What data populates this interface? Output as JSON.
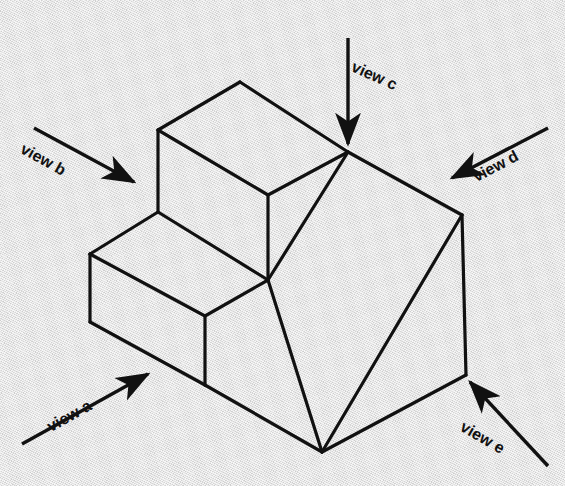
{
  "figure": {
    "kind": "isometric-technical-drawing",
    "background_color": "#e8e8e8",
    "line_color": "#111111",
    "stroke_width_main": 3.2,
    "stroke_width_thin": 2.6
  },
  "annotations": {
    "arrows": [
      {
        "id": "view-a",
        "label": "view a",
        "direction": "up-right",
        "tail": [
          22,
          444
        ],
        "head": [
          148,
          374
        ],
        "label_x": 44,
        "label_y": 420,
        "label_rotation": -29
      },
      {
        "id": "view-b",
        "label": "view b",
        "direction": "down-right",
        "tail": [
          34,
          128
        ],
        "head": [
          134,
          182
        ],
        "label_x": 26,
        "label_y": 140,
        "label_rotation": 29
      },
      {
        "id": "view-c",
        "label": "view c",
        "direction": "down",
        "tail": [
          348,
          38
        ],
        "head": [
          348,
          144
        ],
        "label_x": 356,
        "label_y": 58,
        "label_rotation": 24
      },
      {
        "id": "view-d",
        "label": "view d",
        "direction": "down-left",
        "tail": [
          548,
          128
        ],
        "head": [
          452,
          178
        ],
        "label_x": 470,
        "label_y": 170,
        "label_rotation": -28
      },
      {
        "id": "view-e",
        "label": "view e",
        "direction": "up-left",
        "tail": [
          548,
          466
        ],
        "head": [
          470,
          382
        ],
        "label_x": 466,
        "label_y": 418,
        "label_rotation": 30
      }
    ]
  },
  "solid": {
    "vertices": {
      "top_back": [
        240,
        82
      ],
      "top_left": [
        158,
        130
      ],
      "top_right_apex": [
        348,
        152
      ],
      "upper_riser_mid": [
        268,
        195
      ],
      "step_left": [
        90,
        254
      ],
      "center": [
        268,
        280
      ],
      "lower_left_bot": [
        90,
        322
      ],
      "lower_front_bot": [
        205,
        385
      ],
      "right_top": [
        462,
        215
      ],
      "right_bot": [
        466,
        375
      ],
      "bottom_front": [
        322,
        452
      ]
    },
    "edges": [
      {
        "name": "upper-top-back-left",
        "from": [
          240,
          82
        ],
        "to": [
          158,
          130
        ]
      },
      {
        "name": "upper-top-back-right",
        "from": [
          240,
          82
        ],
        "to": [
          348,
          152
        ]
      },
      {
        "name": "upper-top-front-left",
        "from": [
          158,
          130
        ],
        "to": [
          268,
          195
        ]
      },
      {
        "name": "upper-top-front-right",
        "from": [
          268,
          195
        ],
        "to": [
          348,
          152
        ]
      },
      {
        "name": "upper-left-riser",
        "from": [
          158,
          130
        ],
        "to": [
          158,
          212
        ]
      },
      {
        "name": "upper-mid-riser",
        "from": [
          268,
          195
        ],
        "to": [
          268,
          280
        ]
      },
      {
        "name": "step-tread-left",
        "from": [
          158,
          212
        ],
        "to": [
          90,
          254
        ]
      },
      {
        "name": "step-tread-right",
        "from": [
          158,
          212
        ],
        "to": [
          268,
          280
        ]
      },
      {
        "name": "lower-left-riser",
        "from": [
          90,
          254
        ],
        "to": [
          90,
          322
        ]
      },
      {
        "name": "lower-top-front",
        "from": [
          90,
          254
        ],
        "to": [
          205,
          316
        ]
      },
      {
        "name": "lower-front-right",
        "from": [
          205,
          316
        ],
        "to": [
          268,
          280
        ]
      },
      {
        "name": "lower-front-riser",
        "from": [
          205,
          316
        ],
        "to": [
          205,
          385
        ]
      },
      {
        "name": "bottom-front-left",
        "from": [
          90,
          322
        ],
        "to": [
          205,
          385
        ]
      },
      {
        "name": "bottom-front-right",
        "from": [
          205,
          385
        ],
        "to": [
          322,
          452
        ]
      },
      {
        "name": "ramp-left",
        "from": [
          268,
          280
        ],
        "to": [
          322,
          452
        ]
      },
      {
        "name": "ramp-top",
        "from": [
          348,
          152
        ],
        "to": [
          462,
          215
        ]
      },
      {
        "name": "ramp-diagonal",
        "from": [
          462,
          215
        ],
        "to": [
          322,
          452
        ]
      },
      {
        "name": "right-vertical",
        "from": [
          462,
          215
        ],
        "to": [
          466,
          375
        ]
      },
      {
        "name": "bottom-right",
        "from": [
          466,
          375
        ],
        "to": [
          322,
          452
        ]
      },
      {
        "name": "ramp-slope-face",
        "from": [
          348,
          152
        ],
        "to": [
          268,
          280
        ]
      }
    ]
  }
}
